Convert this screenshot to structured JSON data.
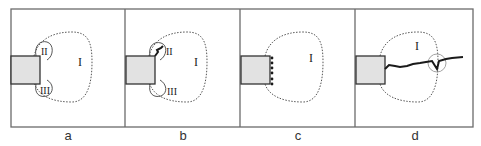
{
  "figure": {
    "panels": [
      {
        "label": "a",
        "regions": [
          "I",
          "II",
          "III"
        ]
      },
      {
        "label": "b",
        "regions": [
          "I",
          "II",
          "III"
        ]
      },
      {
        "label": "c",
        "regions": [
          "I"
        ]
      },
      {
        "label": "d",
        "regions": [
          "I"
        ]
      }
    ],
    "colors": {
      "frame": "#6b6b6b",
      "block_fill": "#e2e2e2",
      "block_stroke": "#333333",
      "dotted": "#555555",
      "crack": "#1a1a1a"
    }
  }
}
